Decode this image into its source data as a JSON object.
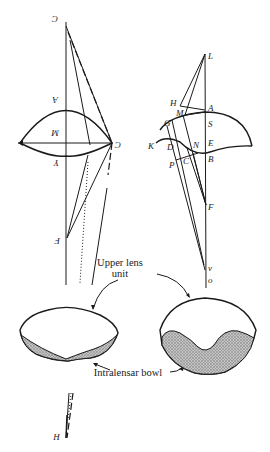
{
  "figure": {
    "left_diagram": {
      "labels": {
        "c_top": "C",
        "a": "A",
        "m": "M",
        "c_right": "C",
        "y": "Y",
        "f": "F",
        "h": "H"
      }
    },
    "right_diagram": {
      "labels": {
        "l": "L",
        "h": "H",
        "m": "M",
        "a": "A",
        "g": "G",
        "s": "S",
        "k": "K",
        "d": "D",
        "n": "N",
        "e": "E",
        "p": "P",
        "c": "C",
        "b": "B",
        "f": "F",
        "v": "v",
        "o": "o"
      }
    },
    "annotations": {
      "upper_lens_line1": "Upper lens",
      "upper_lens_line2": "unit",
      "intralensar_bowl": "Intralensar bowl"
    },
    "colors": {
      "ink": "#1a1a1a",
      "hatch": "#9a9a9a",
      "background": "#ffffff"
    }
  }
}
